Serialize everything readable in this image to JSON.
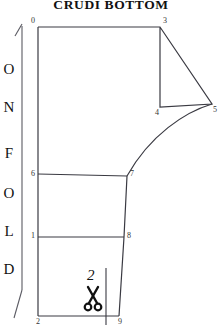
{
  "title": "CRUDI BOTTOM",
  "fold_marker": {
    "letters": [
      "O",
      "N",
      "F",
      "O",
      "L",
      "D"
    ],
    "text": "ON FOLD",
    "arrow": "up-arrow"
  },
  "cut_marker": {
    "number": "2",
    "icon": "scissors-icon"
  },
  "vertices": [
    {
      "id": "0",
      "label": "0",
      "x": 38,
      "y": 27,
      "label_x": 31,
      "label_y": 17
    },
    {
      "id": "3",
      "label": "3",
      "x": 160,
      "y": 27,
      "label_x": 163,
      "label_y": 17
    },
    {
      "id": "4",
      "label": "4",
      "x": 160,
      "y": 107,
      "label_x": 155,
      "label_y": 109
    },
    {
      "id": "5",
      "label": "5",
      "x": 212,
      "y": 104,
      "label_x": 213,
      "label_y": 106
    },
    {
      "id": "7",
      "label": "7",
      "x": 127,
      "y": 176,
      "label_x": 130,
      "label_y": 172
    },
    {
      "id": "6",
      "label": "6",
      "x": 38,
      "y": 174,
      "label_x": 31,
      "label_y": 172
    },
    {
      "id": "8",
      "label": "8",
      "x": 124,
      "y": 237,
      "label_x": 127,
      "label_y": 233
    },
    {
      "id": "1",
      "label": "1",
      "x": 38,
      "y": 237,
      "label_x": 31,
      "label_y": 233
    },
    {
      "id": "9",
      "label": "9",
      "x": 119,
      "y": 316,
      "label_x": 118,
      "label_y": 318
    },
    {
      "id": "2",
      "label": "2",
      "x": 38,
      "y": 316,
      "label_x": 36,
      "label_y": 318
    }
  ],
  "colors": {
    "background": "#ffffff",
    "outline": "#3a3a42",
    "text": "#111111",
    "label": "#333333"
  }
}
